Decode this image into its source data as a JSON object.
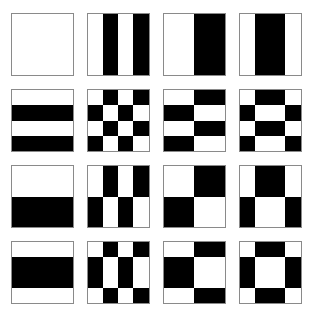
{
  "figure": {
    "grid_rows": 4,
    "grid_cols": 4,
    "tile_size_px": 63,
    "tile_gap_px": 13,
    "background_color": "#ffffff",
    "foreground_color": "#000000",
    "tile_border_color": "#8a8a8a"
  },
  "sequency_vectors": {
    "v0": [
      1,
      1,
      1,
      1
    ],
    "v1": [
      1,
      -1,
      1,
      -1
    ],
    "v2": [
      1,
      1,
      -1,
      -1
    ],
    "v3": [
      1,
      -1,
      -1,
      1
    ]
  },
  "row_vector_order": [
    "v0",
    "v1",
    "v2",
    "v3"
  ],
  "col_vector_order": [
    "v0",
    "v1",
    "v2",
    "v3"
  ],
  "tiles": [
    {
      "name": "tile-r0-c0",
      "row": 0,
      "col": 0,
      "row_vector": "v0",
      "col_vector": "v0",
      "cells_rows": 1,
      "cells_cols": 1,
      "cells": [
        [
          0
        ]
      ]
    },
    {
      "name": "tile-r0-c1",
      "row": 0,
      "col": 1,
      "row_vector": "v0",
      "col_vector": "v1",
      "cells_rows": 1,
      "cells_cols": 4,
      "cells": [
        [
          0,
          1,
          0,
          1
        ]
      ]
    },
    {
      "name": "tile-r0-c2",
      "row": 0,
      "col": 2,
      "row_vector": "v0",
      "col_vector": "v2",
      "cells_rows": 1,
      "cells_cols": 2,
      "cells": [
        [
          0,
          1
        ]
      ]
    },
    {
      "name": "tile-r0-c3",
      "row": 0,
      "col": 3,
      "row_vector": "v0",
      "col_vector": "v3",
      "cells_rows": 1,
      "cells_cols": 4,
      "cells": [
        [
          0,
          1,
          1,
          0
        ]
      ]
    },
    {
      "name": "tile-r1-c0",
      "row": 1,
      "col": 0,
      "row_vector": "v1",
      "col_vector": "v0",
      "cells_rows": 4,
      "cells_cols": 1,
      "cells": [
        [
          0
        ],
        [
          1
        ],
        [
          0
        ],
        [
          1
        ]
      ]
    },
    {
      "name": "tile-r1-c1",
      "row": 1,
      "col": 1,
      "row_vector": "v1",
      "col_vector": "v1",
      "cells_rows": 4,
      "cells_cols": 4,
      "cells": [
        [
          0,
          1,
          0,
          1
        ],
        [
          1,
          0,
          1,
          0
        ],
        [
          0,
          1,
          0,
          1
        ],
        [
          1,
          0,
          1,
          0
        ]
      ]
    },
    {
      "name": "tile-r1-c2",
      "row": 1,
      "col": 2,
      "row_vector": "v1",
      "col_vector": "v2",
      "cells_rows": 4,
      "cells_cols": 2,
      "cells": [
        [
          0,
          1
        ],
        [
          1,
          0
        ],
        [
          0,
          1
        ],
        [
          1,
          0
        ]
      ]
    },
    {
      "name": "tile-r1-c3",
      "row": 1,
      "col": 3,
      "row_vector": "v1",
      "col_vector": "v3",
      "cells_rows": 4,
      "cells_cols": 4,
      "cells": [
        [
          0,
          1,
          1,
          0
        ],
        [
          1,
          0,
          0,
          1
        ],
        [
          0,
          1,
          1,
          0
        ],
        [
          1,
          0,
          0,
          1
        ]
      ]
    },
    {
      "name": "tile-r2-c0",
      "row": 2,
      "col": 0,
      "row_vector": "v2",
      "col_vector": "v0",
      "cells_rows": 2,
      "cells_cols": 1,
      "cells": [
        [
          0
        ],
        [
          1
        ]
      ]
    },
    {
      "name": "tile-r2-c1",
      "row": 2,
      "col": 1,
      "row_vector": "v2",
      "col_vector": "v1",
      "cells_rows": 2,
      "cells_cols": 4,
      "cells": [
        [
          0,
          1,
          0,
          1
        ],
        [
          1,
          0,
          1,
          0
        ]
      ]
    },
    {
      "name": "tile-r2-c2",
      "row": 2,
      "col": 2,
      "row_vector": "v2",
      "col_vector": "v2",
      "cells_rows": 2,
      "cells_cols": 2,
      "cells": [
        [
          0,
          1
        ],
        [
          1,
          0
        ]
      ]
    },
    {
      "name": "tile-r2-c3",
      "row": 2,
      "col": 3,
      "row_vector": "v2",
      "col_vector": "v3",
      "cells_rows": 2,
      "cells_cols": 4,
      "cells": [
        [
          0,
          1,
          1,
          0
        ],
        [
          1,
          0,
          0,
          1
        ]
      ]
    },
    {
      "name": "tile-r3-c0",
      "row": 3,
      "col": 0,
      "row_vector": "v3",
      "col_vector": "v0",
      "cells_rows": 4,
      "cells_cols": 1,
      "cells": [
        [
          0
        ],
        [
          1
        ],
        [
          1
        ],
        [
          0
        ]
      ]
    },
    {
      "name": "tile-r3-c1",
      "row": 3,
      "col": 1,
      "row_vector": "v3",
      "col_vector": "v1",
      "cells_rows": 4,
      "cells_cols": 4,
      "cells": [
        [
          0,
          1,
          0,
          1
        ],
        [
          1,
          0,
          1,
          0
        ],
        [
          1,
          0,
          1,
          0
        ],
        [
          0,
          1,
          0,
          1
        ]
      ]
    },
    {
      "name": "tile-r3-c2",
      "row": 3,
      "col": 2,
      "row_vector": "v3",
      "col_vector": "v2",
      "cells_rows": 4,
      "cells_cols": 2,
      "cells": [
        [
          0,
          1
        ],
        [
          1,
          0
        ],
        [
          1,
          0
        ],
        [
          0,
          1
        ]
      ]
    },
    {
      "name": "tile-r3-c3",
      "row": 3,
      "col": 3,
      "row_vector": "v3",
      "col_vector": "v3",
      "cells_rows": 4,
      "cells_cols": 4,
      "cells": [
        [
          0,
          1,
          1,
          0
        ],
        [
          1,
          0,
          0,
          1
        ],
        [
          1,
          0,
          0,
          1
        ],
        [
          0,
          1,
          1,
          0
        ]
      ]
    }
  ]
}
